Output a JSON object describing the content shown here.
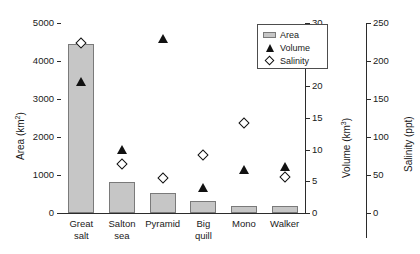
{
  "chart_data": {
    "type": "bar",
    "title": "",
    "xlabel": "",
    "categories": [
      "Great salt",
      "Salton sea",
      "Pyramid",
      "Big quill",
      "Mono",
      "Walker"
    ],
    "category_lines": [
      [
        "Great",
        "salt"
      ],
      [
        "Salton",
        "sea"
      ],
      [
        "Pyramid",
        ""
      ],
      [
        "Big",
        "quill"
      ],
      [
        "Mono",
        ""
      ],
      [
        "Walker",
        ""
      ]
    ],
    "grid": false,
    "legend_position": "top-right",
    "series": [
      {
        "name": "Area",
        "marker": "bar",
        "axis": "left",
        "values": [
          4450,
          820,
          530,
          320,
          190,
          185
        ]
      },
      {
        "name": "Volume",
        "marker": "filled-triangle",
        "axis": "right-1",
        "values": [
          20.8,
          10.1,
          27.6,
          4.1,
          6.8,
          7.3
        ]
      },
      {
        "name": "Salinity",
        "marker": "open-diamond",
        "axis": "right-2",
        "values": [
          224,
          64,
          46,
          76,
          118,
          47
        ]
      }
    ],
    "axes": {
      "left": {
        "label": "Area (km2)",
        "label_base": "Area (km",
        "label_sup": "2",
        "label_tail": ")",
        "ylim": [
          0,
          5000
        ],
        "ticks": [
          0,
          1000,
          2000,
          3000,
          4000,
          5000
        ]
      },
      "right_1": {
        "label": "Volume (km3)",
        "label_base": "Volume (km",
        "label_sup": "3",
        "label_tail": ")",
        "ylim": [
          0,
          30
        ],
        "ticks": [
          0,
          5,
          10,
          15,
          20,
          25,
          30
        ]
      },
      "right_2": {
        "label": "Salinity (ppt)",
        "label_base": "Salinity (ppt)",
        "label_sup": "",
        "label_tail": "",
        "ylim": [
          0,
          250
        ],
        "ticks": [
          0,
          50,
          100,
          150,
          200,
          250
        ]
      }
    }
  },
  "legend": {
    "items": [
      {
        "label": "Area",
        "symbol": "bar-swatch"
      },
      {
        "label": "Volume",
        "symbol": "filled-triangle"
      },
      {
        "label": "Salinity",
        "symbol": "open-diamond"
      }
    ]
  },
  "colors": {
    "bar_fill": "#c6c6c6",
    "bar_edge": "#7a7a7a",
    "marker": "#111111",
    "axis": "#2b2b2b",
    "background": "#ffffff"
  }
}
